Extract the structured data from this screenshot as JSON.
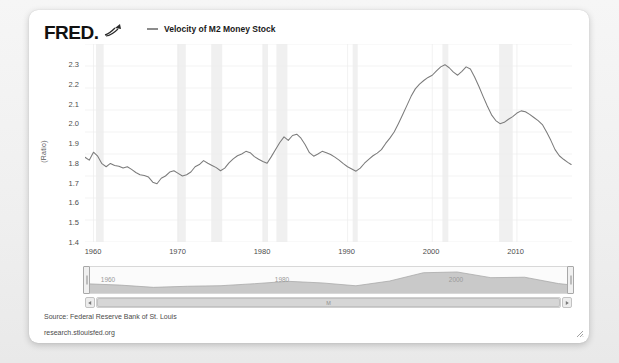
{
  "card": {
    "logo_text": "FRED",
    "logo_suffix": ".",
    "swoosh_icon": "trend-line-icon"
  },
  "legend": {
    "series_label": "Velocity of M2 Money Stock",
    "swatch_color": "#8c8c8c"
  },
  "footer": {
    "source": "Source: Federal Reserve Bank of St. Louis",
    "url": "research.stlouisfed.org"
  },
  "navigator": {
    "left_year": "1960",
    "mid_year": "1980",
    "right_year": "2000",
    "scrollbar_label": "M",
    "left_arrow_icon": "chevron-left-icon",
    "right_arrow_icon": "chevron-right-icon",
    "left_handle_name": "range-handle-left",
    "right_handle_name": "range-handle-right"
  },
  "chart_data": {
    "type": "line",
    "title": "",
    "xlabel": "",
    "ylabel": "(Ratio)",
    "ylim": [
      1.4,
      2.3
    ],
    "xlim": [
      1959,
      2016.5
    ],
    "grid": true,
    "legend_position": "top",
    "line_color": "#7b7b7b",
    "recession_band_color": "#f0f0f0",
    "yticks": [
      "1.4",
      "1.5",
      "1.6",
      "1.7",
      "1.8",
      "1.9",
      "2.0",
      "2.1",
      "2.2",
      "2.3"
    ],
    "xticks": [
      "1960",
      "1970",
      "1980",
      "1990",
      "2000",
      "2010"
    ],
    "series": [
      {
        "name": "Velocity of M2 Money Stock",
        "x": [
          1959.0,
          1959.5,
          1960.0,
          1960.5,
          1961.0,
          1961.5,
          1962.0,
          1962.5,
          1963.0,
          1963.5,
          1964.0,
          1964.5,
          1965.0,
          1965.5,
          1966.0,
          1966.5,
          1967.0,
          1967.5,
          1968.0,
          1968.5,
          1969.0,
          1969.5,
          1970.0,
          1970.5,
          1971.0,
          1971.5,
          1972.0,
          1972.5,
          1973.0,
          1973.5,
          1974.0,
          1974.5,
          1975.0,
          1975.5,
          1976.0,
          1976.5,
          1977.0,
          1977.5,
          1978.0,
          1978.5,
          1979.0,
          1979.5,
          1980.0,
          1980.5,
          1981.0,
          1981.5,
          1982.0,
          1982.5,
          1983.0,
          1983.5,
          1984.0,
          1984.5,
          1985.0,
          1985.5,
          1986.0,
          1986.5,
          1987.0,
          1987.5,
          1988.0,
          1988.5,
          1989.0,
          1989.5,
          1990.0,
          1990.5,
          1991.0,
          1991.5,
          1992.0,
          1992.5,
          1993.0,
          1993.5,
          1994.0,
          1994.5,
          1995.0,
          1995.5,
          1996.0,
          1996.5,
          1997.0,
          1997.5,
          1998.0,
          1998.5,
          1999.0,
          1999.5,
          2000.0,
          2000.5,
          2001.0,
          2001.5,
          2002.0,
          2002.5,
          2003.0,
          2003.5,
          2004.0,
          2004.5,
          2005.0,
          2005.5,
          2006.0,
          2006.5,
          2007.0,
          2007.5,
          2008.0,
          2008.5,
          2009.0,
          2009.5,
          2010.0,
          2010.5,
          2011.0,
          2011.5,
          2012.0,
          2012.5,
          2013.0,
          2013.5,
          2014.0,
          2014.5,
          2015.0,
          2015.5,
          2016.0,
          2016.4
        ],
        "values": [
          1.785,
          1.772,
          1.808,
          1.79,
          1.756,
          1.742,
          1.757,
          1.748,
          1.744,
          1.736,
          1.742,
          1.73,
          1.716,
          1.706,
          1.702,
          1.695,
          1.672,
          1.665,
          1.69,
          1.7,
          1.718,
          1.724,
          1.712,
          1.7,
          1.706,
          1.718,
          1.742,
          1.752,
          1.77,
          1.758,
          1.748,
          1.738,
          1.724,
          1.736,
          1.76,
          1.778,
          1.792,
          1.8,
          1.812,
          1.806,
          1.788,
          1.776,
          1.766,
          1.758,
          1.788,
          1.82,
          1.852,
          1.878,
          1.862,
          1.884,
          1.89,
          1.872,
          1.842,
          1.806,
          1.79,
          1.8,
          1.812,
          1.806,
          1.798,
          1.786,
          1.772,
          1.756,
          1.742,
          1.732,
          1.722,
          1.736,
          1.758,
          1.776,
          1.792,
          1.804,
          1.82,
          1.848,
          1.872,
          1.9,
          1.938,
          1.978,
          2.02,
          2.062,
          2.096,
          2.118,
          2.134,
          2.148,
          2.158,
          2.178,
          2.196,
          2.206,
          2.192,
          2.172,
          2.158,
          2.176,
          2.196,
          2.186,
          2.15,
          2.108,
          2.062,
          2.018,
          1.978,
          1.952,
          1.938,
          1.944,
          1.958,
          1.97,
          1.986,
          1.996,
          1.992,
          1.98,
          1.966,
          1.952,
          1.934,
          1.9,
          1.862,
          1.82,
          1.792,
          1.776,
          1.762,
          1.752
        ]
      }
    ],
    "recession_bands": [
      [
        1960.3,
        1961.2
      ],
      [
        1969.9,
        1970.9
      ],
      [
        1973.9,
        1975.2
      ],
      [
        1980.0,
        1980.6
      ],
      [
        1981.6,
        1982.9
      ],
      [
        1990.6,
        1991.2
      ],
      [
        2001.2,
        2001.9
      ],
      [
        2007.9,
        2009.5
      ]
    ],
    "navigator_series": {
      "x": [
        1959,
        1963,
        1967,
        1971,
        1975,
        1979,
        1983,
        1987,
        1991,
        1995,
        1999,
        2003,
        2007,
        2011,
        2015,
        2016.4
      ],
      "values": [
        1.785,
        1.744,
        1.672,
        1.706,
        1.724,
        1.788,
        1.862,
        1.812,
        1.722,
        1.872,
        2.134,
        2.158,
        1.978,
        1.992,
        1.792,
        1.752
      ]
    }
  }
}
